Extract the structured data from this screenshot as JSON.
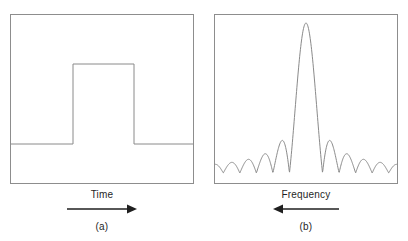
{
  "figure": {
    "type": "signal-transform-pair-diagram",
    "panels": [
      {
        "id": "a",
        "letter": "(a)",
        "axis_label": "Time",
        "arrow_direction": "right",
        "arrow_icon": "arrow-right-icon",
        "waveform": "rectangular-pulse",
        "description": "Rectangular pulse in the time domain"
      },
      {
        "id": "b",
        "letter": "(b)",
        "axis_label": "Frequency",
        "arrow_direction": "left",
        "arrow_icon": "arrow-left-icon",
        "waveform": "sinc-magnitude",
        "description": "Sinc magnitude spectrum in the frequency domain"
      }
    ]
  },
  "colors": {
    "background": "#ffffff",
    "box_stroke": "#8d8d8d",
    "curve_stroke": "#8a8a8a",
    "arrow": "#1f1f1f",
    "text": "#1f1f1f"
  },
  "chart_data": [
    {
      "type": "line",
      "title": "",
      "xlabel": "Time",
      "ylabel": "",
      "series_name": "Rectangular pulse",
      "grid": false,
      "legend": "none",
      "xlim": [
        0,
        184
      ],
      "ylim": [
        0,
        170
      ],
      "baseline_level": 129,
      "pulse_top_level": 49,
      "pulse_start_x": 62,
      "pulse_end_x": 123,
      "points": [
        [
          0,
          129
        ],
        [
          62,
          129
        ],
        [
          62,
          49
        ],
        [
          123,
          49
        ],
        [
          123,
          129
        ],
        [
          184,
          129
        ]
      ]
    },
    {
      "type": "line",
      "title": "",
      "xlabel": "Frequency",
      "ylabel": "",
      "series_name": "Sinc magnitude",
      "grid": false,
      "legend": "none",
      "xlim": [
        -5.5,
        5.5
      ],
      "ylim": [
        0,
        1
      ],
      "baseline_level": 158,
      "peak_level": 8,
      "peak_x": 91,
      "main_lobe_half_width": 28,
      "function": "abs(sinc(x))",
      "x": [
        -5.5,
        -5.25,
        -5,
        -4.75,
        -4.5,
        -4.25,
        -4,
        -3.75,
        -3.5,
        -3.25,
        -3,
        -2.75,
        -2.5,
        -2.25,
        -2,
        -1.75,
        -1.5,
        -1.25,
        -1,
        -0.75,
        -0.5,
        -0.25,
        0,
        0.25,
        0.5,
        0.75,
        1,
        1.25,
        1.5,
        1.75,
        2,
        2.25,
        2.5,
        2.75,
        3,
        3.25,
        3.5,
        3.75,
        4,
        4.25,
        4.5,
        4.75,
        5,
        5.25,
        5.5
      ],
      "y": [
        0.0518,
        0.0546,
        0.0637,
        0.0468,
        0.0212,
        0.0155,
        0.0,
        0.0281,
        0.0909,
        0.0842,
        0.0,
        0.0376,
        0.1273,
        0.1165,
        0.0,
        0.0505,
        0.2122,
        0.1876,
        0.0,
        0.0901,
        0.6366,
        0.9003,
        1.0,
        0.9003,
        0.6366,
        0.0901,
        0.0,
        0.1876,
        0.2122,
        0.0505,
        0.0,
        0.1165,
        0.1273,
        0.0376,
        0.0,
        0.0842,
        0.0909,
        0.0281,
        0.0,
        0.0155,
        0.0212,
        0.0468,
        0.0637,
        0.0546,
        0.0518
      ]
    }
  ]
}
